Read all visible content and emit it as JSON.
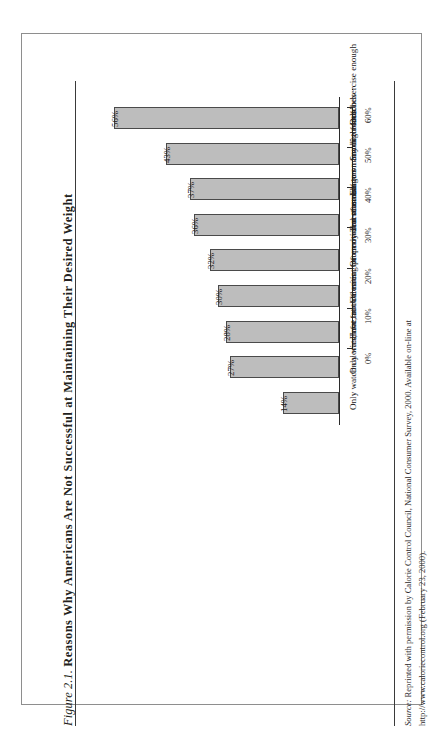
{
  "figure": {
    "number": "Figure 2.1.",
    "title": "Reasons Why Americans Are Not Successful at Maintaining Their Desired Weight",
    "source_label": "Source:",
    "source_line1": "Reprinted with permission by Calorie Control Council, National Consumer Survey, 2000. Available on-line at",
    "source_line2": "http://www.caloriecontrol.org (February 23, 2000).",
    "bar_fill": "#bdbdbd",
    "bar_border": "#4a4a4a",
    "axis_color": "#2b2b2b"
  },
  "chart_data": {
    "type": "bar",
    "title": "Reasons Why Americans Are Not Successful at Maintaining Their Desired Weight",
    "xlabel": "",
    "ylabel": "",
    "orientation": "vertical",
    "grid": false,
    "legend": false,
    "ylim": [
      0,
      60
    ],
    "tick_labels": [
      "0%",
      "10%",
      "20%",
      "30%",
      "40%",
      "50%",
      "60%"
    ],
    "tick_values": [
      0,
      10,
      20,
      30,
      40,
      50,
      60
    ],
    "categories": [
      "Don't exercise enough",
      "Snack too much",
      "Eat too many high-fat foods",
      "Too often binge on favorite foods",
      "Often overeat at mealtimes",
      "Often eat for emotional reasons",
      "Have trouble eating properly at restaurants",
      "Only watch fat, not calories",
      "Only watch calories, not fat"
    ],
    "values": [
      56,
      43,
      37,
      36,
      32,
      30,
      28,
      27,
      14
    ],
    "value_labels": [
      "56%",
      "43%",
      "37%",
      "36%",
      "32%",
      "30%",
      "28%",
      "27%",
      "14%"
    ]
  }
}
